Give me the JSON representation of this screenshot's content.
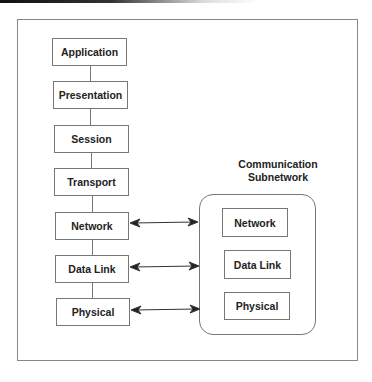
{
  "diagram": {
    "host_stack": [
      {
        "label": "Application"
      },
      {
        "label": "Presentation"
      },
      {
        "label": "Session"
      },
      {
        "label": "Transport"
      },
      {
        "label": "Network"
      },
      {
        "label": "Data Link"
      },
      {
        "label": "Physical"
      }
    ],
    "subnetwork": {
      "title_line1": "Communication",
      "title_line2": "Subnetwork",
      "layers": [
        {
          "label": "Network"
        },
        {
          "label": "Data Link"
        },
        {
          "label": "Physical"
        }
      ]
    },
    "connections": [
      {
        "from": "Network",
        "to": "Subnetwork",
        "type": "bidirectional"
      },
      {
        "from": "Data Link",
        "to": "Subnetwork",
        "type": "bidirectional"
      },
      {
        "from": "Physical",
        "to": "Subnetwork",
        "type": "bidirectional"
      }
    ]
  }
}
